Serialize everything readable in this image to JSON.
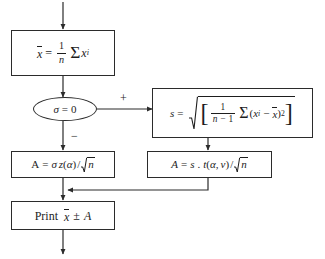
{
  "diagram": {
    "background_color": "#ffffff",
    "stroke_color": "#2b2b2b",
    "text_color": "#1d1d1d"
  },
  "nodes": {
    "mean_box": {
      "id": "mean-box",
      "shape": "rectangle",
      "text": "x̄ = (1/n) Σ xᵢ",
      "parts": {
        "lhs": "x",
        "equals": "=",
        "frac_num": "1",
        "frac_den": "n",
        "sum": "Σ",
        "var": "x",
        "var_sub": "i"
      }
    },
    "decision": {
      "id": "sigma-decision",
      "shape": "ellipse",
      "text": "σ = 0",
      "parts": {
        "sigma": "σ",
        "equals": "=",
        "value": "0"
      }
    },
    "sd_box": {
      "id": "sample-sd-box",
      "shape": "rectangle",
      "text": "s = √[ 1/(n − 1) Σ(xᵢ − x̄)² ]",
      "parts": {
        "lhs": "s",
        "equals": "=",
        "bracket_open": "[",
        "frac_num": "1",
        "frac_den_n": "n",
        "frac_den_minus": "−",
        "frac_den_one": "1",
        "sum": "Σ",
        "paren_open": "(",
        "var": "x",
        "var_sub": "i",
        "minus": "−",
        "mean": "x",
        "paren_close": ")",
        "power": "2",
        "bracket_close": "]"
      }
    },
    "a_sigma_box": {
      "id": "a-sigma-box",
      "shape": "rectangle",
      "text": "A = σ z(α)/√n",
      "parts": {
        "lhs": "A",
        "equals": "=",
        "sigma": "σ",
        "z": "z",
        "paren_open": "(",
        "alpha": "α",
        "paren_close": ")",
        "slash": "/",
        "n": "n"
      }
    },
    "a_s_box": {
      "id": "a-s-box",
      "shape": "rectangle",
      "text": "A = s . t(α, v)/√n",
      "parts": {
        "lhs": "A",
        "equals": "=",
        "s": "s",
        "dot": ".",
        "t": "t",
        "paren_open": "(",
        "alpha": "α",
        "comma": ",",
        "v": "v",
        "paren_close": ")",
        "slash": "/",
        "n": "n"
      }
    },
    "print_box": {
      "id": "print-box",
      "shape": "rectangle",
      "text": "Print x̄ ± A",
      "parts": {
        "keyword": "Print",
        "mean": "x",
        "pm": "±",
        "a": "A"
      }
    }
  },
  "edges": {
    "entry": {
      "label": "",
      "from": "top",
      "to": "mean_box"
    },
    "mean_to_decision": {
      "label": ""
    },
    "decision_true": {
      "label": "+",
      "to": "sd_box"
    },
    "decision_false": {
      "label": "−",
      "to": "a_sigma_box"
    },
    "sd_to_a_s": {
      "label": ""
    },
    "a_sigma_to_print": {
      "label": ""
    },
    "a_s_to_print": {
      "label": ""
    },
    "exit": {
      "label": "",
      "from": "print_box"
    }
  }
}
